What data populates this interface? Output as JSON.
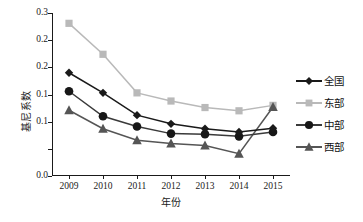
{
  "chart_data": {
    "type": "line",
    "title": "",
    "xlabel": "年份",
    "ylabel": "基尼系数",
    "x": [
      "2009",
      "2010",
      "2011",
      "2012",
      "2013",
      "2014",
      "2015"
    ],
    "xtick_labels": [
      "2009",
      "2010",
      "2011",
      "2012",
      "2013",
      "2014",
      "2015"
    ],
    "ytick_labels": [
      "0.3",
      "0.2",
      "0.2",
      "0.1",
      "0.1",
      "0.0"
    ],
    "ytick_values": [
      0.3,
      0.25,
      0.2,
      0.15,
      0.1,
      0.05,
      0.0
    ],
    "ylim": [
      0.0,
      0.3
    ],
    "grid": false,
    "legend_position": "right",
    "series": [
      {
        "name": "全国",
        "marker": "diamond",
        "color": "#1a1a1a",
        "line_color": "#1a1a1a",
        "values": [
          0.19,
          0.153,
          0.112,
          0.096,
          0.087,
          0.081,
          0.088
        ]
      },
      {
        "name": "东部",
        "marker": "square",
        "color": "#b9b9b9",
        "line_color": "#b9b9b9",
        "values": [
          0.281,
          0.224,
          0.153,
          0.138,
          0.126,
          0.12,
          0.13
        ]
      },
      {
        "name": "中部",
        "marker": "circle",
        "color": "#171717",
        "line_color": "#3a3a3a",
        "values": [
          0.156,
          0.11,
          0.091,
          0.078,
          0.077,
          0.073,
          0.081
        ]
      },
      {
        "name": "西部",
        "marker": "triangle",
        "color": "#555555",
        "line_color": "#555555",
        "values": [
          0.121,
          0.087,
          0.066,
          0.06,
          0.056,
          0.041,
          0.127
        ]
      }
    ]
  },
  "legend": {
    "items": [
      {
        "label": "全国"
      },
      {
        "label": "东部"
      },
      {
        "label": "中部"
      },
      {
        "label": "西部"
      }
    ]
  }
}
